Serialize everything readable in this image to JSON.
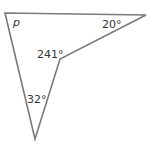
{
  "diagram": {
    "type": "concave-quadrilateral",
    "stroke_color": "#7a7a7a",
    "label_color": "#333333",
    "vertices": [
      {
        "name": "top-left",
        "x": 5,
        "y": 13,
        "angle_label": "p"
      },
      {
        "name": "top-right",
        "x": 146,
        "y": 15,
        "angle_label": "20°"
      },
      {
        "name": "reflex",
        "x": 60,
        "y": 59,
        "angle_label": "241°"
      },
      {
        "name": "bottom",
        "x": 35,
        "y": 139,
        "angle_label": "32°"
      }
    ],
    "labels": {
      "p": "p",
      "top_right": "20°",
      "reflex": "241°",
      "bottom": "32°"
    }
  }
}
